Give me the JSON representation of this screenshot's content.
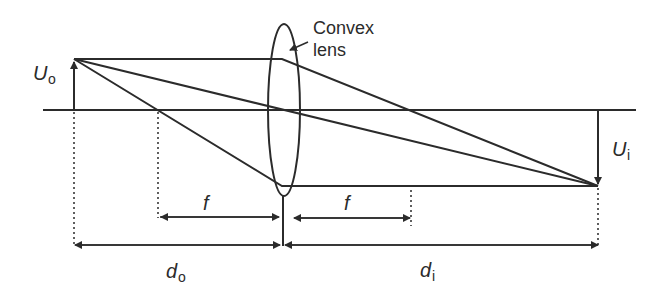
{
  "diagram": {
    "lens_label_line1": "Convex",
    "lens_label_line2": "lens",
    "object_height_label": "U",
    "object_height_sub": "o",
    "image_height_label": "U",
    "image_height_sub": "i",
    "focal_label_left": "f",
    "focal_label_right": "f",
    "object_distance_label": "d",
    "object_distance_sub": "o",
    "image_distance_label": "d",
    "image_distance_sub": "i",
    "colors": {
      "line": "#2b2b2b",
      "background": "#ffffff"
    }
  }
}
